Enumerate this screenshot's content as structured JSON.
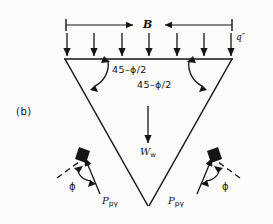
{
  "figure": {
    "panel_label": "(b)",
    "width_label": "B",
    "surcharge_label": "q″",
    "angle_label_left": "45–ϕ/2",
    "angle_label_right": "45–ϕ/2",
    "weight_symbol": "W",
    "weight_subscript": "w",
    "passive_symbol": "P",
    "passive_subscript_left": "pγ",
    "passive_subscript_right": "pγ",
    "friction_label_left": "ϕ",
    "friction_label_right": "ϕ",
    "arrow_count_surcharge": 7,
    "colors": {
      "ink": "#151515",
      "background": "#fbfbf9"
    }
  }
}
